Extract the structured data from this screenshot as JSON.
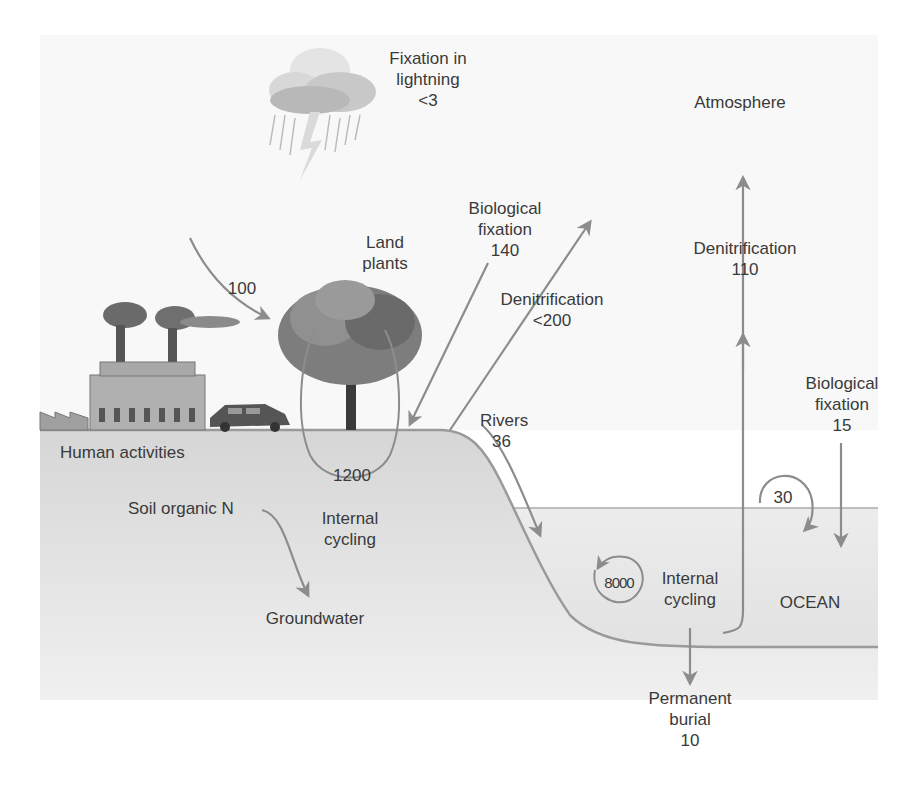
{
  "colors": {
    "background": "#ffffff",
    "sky_panel": "#f7f7f7",
    "land": "#d9d9d9",
    "ocean": "#e8e8e8",
    "arrow": "#8c8c8c",
    "text": "#3a3a3a"
  },
  "regions": {
    "atmosphere": "Atmosphere",
    "ocean": "OCEAN"
  },
  "labels": {
    "lightning": {
      "line1": "Fixation in",
      "line2": "lightning",
      "value": "<3"
    },
    "land_plants": {
      "line1": "Land",
      "line2": "plants"
    },
    "human_input": {
      "value": "100"
    },
    "human_activities": "Human activities",
    "land_bio_fixation": {
      "line1": "Biological",
      "line2": "fixation",
      "value": "140"
    },
    "land_denitrification": {
      "line1": "Denitrification",
      "value": "<200"
    },
    "land_internal": {
      "value": "1200",
      "line1": "Internal",
      "line2": "cycling"
    },
    "soil_organic": "Soil organic N",
    "groundwater": "Groundwater",
    "rivers": {
      "line1": "Rivers",
      "value": "36"
    },
    "ocean_denitrification": {
      "line1": "Denitrification",
      "value": "110"
    },
    "ocean_bio_fixation": {
      "line1": "Biological",
      "line2": "fixation",
      "value": "15"
    },
    "ocean_recycle": {
      "value": "30"
    },
    "ocean_internal": {
      "value": "8000",
      "line1": "Internal",
      "line2": "cycling"
    },
    "burial": {
      "line1": "Permanent",
      "line2": "burial",
      "value": "10"
    }
  },
  "icons": [
    "storm-cloud-icon",
    "lightning-bolt-icon",
    "factory-icon",
    "car-icon",
    "tree-icon"
  ]
}
